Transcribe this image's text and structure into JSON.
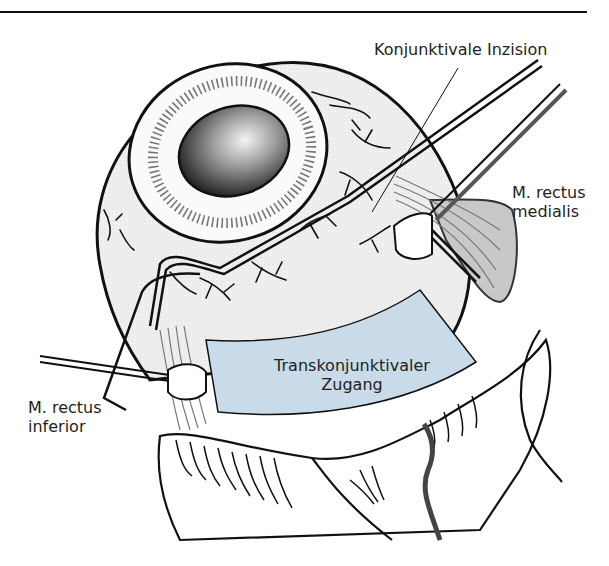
{
  "figure": {
    "colors": {
      "line": "#111111",
      "sclera": "#ececec",
      "region_fill": "#c9dae8",
      "muscle": "#9a9a9a",
      "tissue_fold": "#ffffff",
      "pupil_dark": "#2a2a2a",
      "pupil_light": "#f2f2f2"
    }
  },
  "labels": {
    "incision": "Konjunktivale Inzision",
    "medial_line1": "M. rectus",
    "medial_line2": "medialis",
    "inferior_line1": "M. rectus",
    "inferior_line2": "inferior",
    "approach_line1": "Transkonjunktivaler",
    "approach_line2": "Zugang"
  }
}
